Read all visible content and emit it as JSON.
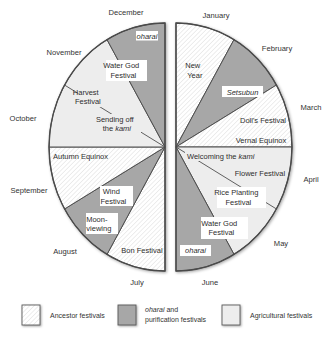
{
  "diagram": {
    "title": "",
    "months": {
      "january": "January",
      "february": "February",
      "march": "March",
      "april": "April",
      "may": "May",
      "june": "June",
      "july": "July",
      "august": "August",
      "september": "September",
      "october": "October",
      "november": "November",
      "december": "December"
    },
    "right_half": {
      "new_year": {
        "line1": "New",
        "line2": "Year"
      },
      "setsubun": "Setsubun",
      "dolls_festival": "Doll's Festival",
      "vernal_equinox": "Vernal Equinox",
      "welcoming_kami": {
        "text": "Welcoming the ",
        "italic": "kami"
      },
      "flower_festival": "Flower Festival",
      "rice_planting": {
        "line1": "Rice Planting",
        "line2": "Festival"
      },
      "water_god": {
        "line1": "Water God",
        "line2": "Festival"
      },
      "oharai": "oharai"
    },
    "left_half": {
      "oharai": "oharai",
      "water_god": {
        "line1": "Water God",
        "line2": "Festival"
      },
      "harvest": {
        "line1": "Harvest",
        "line2": "Festival"
      },
      "sending_off": {
        "line1": "Sending off",
        "line2_text": "the ",
        "line2_italic": "kami"
      },
      "autumn_equinox": "Autumn Equinox",
      "wind": {
        "line1": "Wind",
        "line2": "Festival"
      },
      "moon_viewing": {
        "line1": "Moon-",
        "line2": "viewing"
      },
      "bon": "Bon Festival"
    }
  },
  "segments": [
    {
      "half": "right",
      "start_deg": 0,
      "end_deg": 30,
      "category": "ancestor",
      "festivals": [
        "New Year"
      ]
    },
    {
      "half": "right",
      "start_deg": 30,
      "end_deg": 60,
      "category": "oharai",
      "festivals": [
        "Setsubun"
      ]
    },
    {
      "half": "right",
      "start_deg": 60,
      "end_deg": 90,
      "category": "ancestor",
      "festivals": [
        "Doll's Festival",
        "Vernal Equinox"
      ]
    },
    {
      "half": "right",
      "start_deg": 90,
      "end_deg": 150,
      "category": "agricultural",
      "festivals": [
        "Welcoming the kami",
        "Flower Festival",
        "Rice Planting Festival"
      ]
    },
    {
      "half": "right",
      "start_deg": 150,
      "end_deg": 180,
      "category": "oharai",
      "festivals": [
        "Water God Festival",
        "oharai"
      ]
    },
    {
      "half": "left",
      "start_deg": 180,
      "end_deg": 210,
      "category": "ancestor",
      "festivals": [
        "Bon Festival"
      ]
    },
    {
      "half": "left",
      "start_deg": 210,
      "end_deg": 240,
      "category": "oharai",
      "festivals": [
        "Wind Festival",
        "Moon-viewing"
      ]
    },
    {
      "half": "left",
      "start_deg": 240,
      "end_deg": 270,
      "category": "ancestor",
      "festivals": [
        "Autumn Equinox"
      ]
    },
    {
      "half": "left",
      "start_deg": 270,
      "end_deg": 330,
      "category": "agricultural",
      "festivals": [
        "Harvest Festival",
        "Sending off the kami"
      ]
    },
    {
      "half": "left",
      "start_deg": 330,
      "end_deg": 360,
      "category": "oharai",
      "festivals": [
        "Water God Festival",
        "oharai"
      ]
    }
  ],
  "legend": {
    "ancestor": "Ancestor festivals",
    "oharai": {
      "italic": "oharai",
      "rest": " and",
      "line2": "purification festivals"
    },
    "agricultural": "Agricultural festivals"
  },
  "colors": {
    "ancestor": "#ffffff",
    "hatch": "#d9d9d9",
    "oharai": "#a7a7a7",
    "agricultural": "#ededed",
    "outline": "#4f4f4f"
  }
}
